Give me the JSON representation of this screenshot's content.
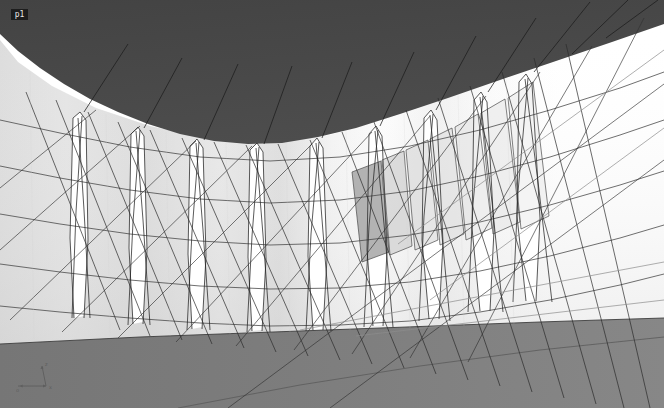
{
  "viewport": {
    "label": "p1",
    "width": 664,
    "height": 408,
    "background_color": "#ffffff",
    "render_mode": "shaded-with-edges"
  },
  "axis_triad": {
    "name": "axis-indicator",
    "vertical_axis_label": "z",
    "horizontal_axis_label": "x",
    "origin_label": "o",
    "color": "#5e5e5e"
  },
  "palette": {
    "ceiling_dark": "#474747",
    "ceiling_dark_edge": "#3f3f3f",
    "floor_gray": "#7d7d7d",
    "floor_gray_far": "#8a8a8a",
    "wall_light": "#e9e9e9",
    "wall_highlight": "#fafafa",
    "wall_shadow": "#d2d2d2",
    "fin_white": "#ffffff",
    "panel_translucent": "#d8d8d8",
    "panel_dark_quad": "#a0a0a0",
    "line_dark": "#2b2b2b",
    "line_mid": "#6b6b6b",
    "line_light": "#9a9a9a",
    "background": "#ffffff"
  },
  "geometry": {
    "description": "Curved shell structure viewed from inside: dark canopy above, light curved wall with vertical fin slots, sloping gray ground plane, and a dense network of thin cable lines.",
    "ceiling": {
      "name": "canopy-surface",
      "fill": "#474747",
      "outline_points": "0,0 664,0 664,26 560,62 470,92 392,118 330,136 268,144 210,141 150,128 96,110 52,88 18,64 0,46"
    },
    "wall": {
      "name": "curved-wall-surface",
      "fill_from": "#d9d9d9",
      "fill_to": "#fbfbfb"
    },
    "floor": {
      "name": "ground-plane",
      "fill": "#7d7d7d",
      "near_edge_y": 336,
      "far_edge_y": 318
    },
    "fins": {
      "name": "vertical-fin-slots",
      "count": 9,
      "fill": "#ffffff"
    },
    "panels": {
      "name": "translucent-panels",
      "count": 7,
      "fill": "#d8d8d8",
      "opacity": 0.62
    },
    "cables": {
      "name": "cable-network",
      "approx_count": 70,
      "stroke": "#2b2b2b",
      "stroke_width": 0.7
    },
    "rings": {
      "name": "horizontal-ring-lines",
      "count": 5,
      "stroke": "#4a4a4a"
    }
  }
}
